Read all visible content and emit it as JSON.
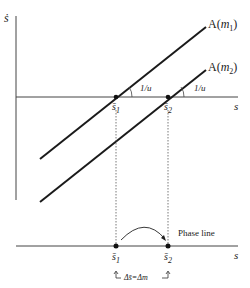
{
  "diagram": {
    "y_axis_label": "ṡ",
    "x_axis_label_top": "s",
    "x_axis_label_bottom": "s",
    "curves": [
      {
        "label_prefix": "A(",
        "label_var": "m",
        "label_sub": "1",
        "label_suffix": ")",
        "slope_label": "1/u"
      },
      {
        "label_prefix": "A(",
        "label_var": "m",
        "label_sub": "2",
        "label_suffix": ")",
        "slope_label": "1/u"
      }
    ],
    "equilibria": [
      {
        "var": "s̄",
        "sub": "1"
      },
      {
        "var": "s̄",
        "sub": "2"
      }
    ],
    "phase_line_label": "Phase line",
    "shift_label": "Δs̄=Δm"
  },
  "colors": {
    "line": "#1a1a1a",
    "axis": "#333333",
    "background": "#ffffff"
  }
}
